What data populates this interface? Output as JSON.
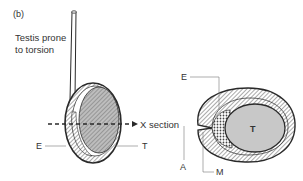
{
  "panel_label": "(b)",
  "caption": {
    "line1": "Testis prone",
    "line2": "to torsion"
  },
  "left_figure": {
    "labels": {
      "E": "E",
      "T": "T"
    },
    "section_arrow_label": "X section"
  },
  "right_figure": {
    "labels": {
      "E": "E",
      "T": "T",
      "A": "A",
      "M": "M"
    }
  },
  "colors": {
    "outline": "#2a2a2a",
    "hatch": "#555555",
    "testis_fill": "#c8c8c8",
    "background": "#ffffff"
  }
}
